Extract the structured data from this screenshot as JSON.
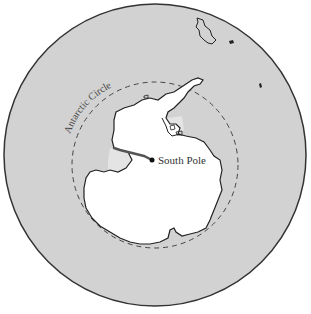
{
  "map": {
    "projection": "south-polar",
    "colors": {
      "ocean": "#d2d2d2",
      "land": "#ffffff",
      "ice_shelf": "#e4e4e4",
      "outline": "#222222",
      "circle_line": "#444444",
      "route": "#555555"
    },
    "labels": {
      "south_pole": "South Pole",
      "antarctic_circle": "Antarctic Circle"
    },
    "features": [
      {
        "name": "Antarctica",
        "type": "continent"
      },
      {
        "name": "Antarctic Peninsula",
        "type": "peninsula"
      },
      {
        "name": "South America (tip)",
        "type": "continent-fragment"
      },
      {
        "name": "Antarctic Circle",
        "type": "dashed-latitude-line"
      },
      {
        "name": "Route to South Pole",
        "type": "path"
      },
      {
        "name": "South Pole",
        "type": "point"
      }
    ]
  }
}
